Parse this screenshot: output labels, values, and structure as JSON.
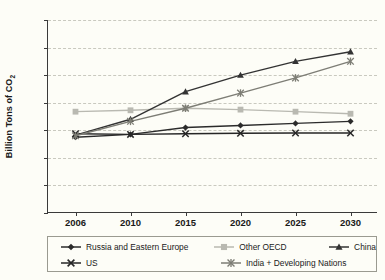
{
  "chart_data": {
    "type": "line",
    "title": "",
    "xlabel": "",
    "ylabel": "Billion Tons of CO",
    "ylabel_sub": "2",
    "categories": [
      "2006",
      "2010",
      "2015",
      "2020",
      "2025",
      "2030"
    ],
    "ylim": [
      0,
      14
    ],
    "ytick_step": 2,
    "yticks": [
      "0",
      "2",
      "4",
      "6",
      "8",
      "10",
      "12",
      "14"
    ],
    "grid": "horizontal-dashed",
    "legend_position": "bottom",
    "series": [
      {
        "name": "Russia and Eastern Europe",
        "marker": "diamond",
        "color": "#2b2b2b",
        "values": [
          5.5,
          5.7,
          6.2,
          6.35,
          6.5,
          6.65
        ]
      },
      {
        "name": "Other OECD",
        "marker": "square",
        "color": "#b9b9b1",
        "values": [
          7.35,
          7.45,
          7.6,
          7.5,
          7.35,
          7.2
        ]
      },
      {
        "name": "China",
        "marker": "triangle",
        "color": "#333333",
        "values": [
          5.65,
          6.8,
          8.8,
          10.0,
          11.0,
          11.7
        ]
      },
      {
        "name": "US",
        "marker": "x",
        "color": "#262626",
        "values": [
          5.75,
          5.7,
          5.75,
          5.78,
          5.8,
          5.8
        ]
      },
      {
        "name": "India + Developing Nations",
        "marker": "asterisk",
        "color": "#7d7d75",
        "values": [
          5.6,
          6.65,
          7.6,
          8.7,
          9.8,
          11.0
        ]
      }
    ]
  },
  "legend": {
    "items": [
      {
        "label": "Russia and Eastern Europe"
      },
      {
        "label": "Other OECD"
      },
      {
        "label": "China"
      },
      {
        "label": "US"
      },
      {
        "label": "India + Developing Nations"
      }
    ]
  },
  "colors": {
    "background": "#fdfdf7",
    "axis": "#3a3a3a",
    "grid": "#c9c9bf",
    "text": "#1a1a1a"
  }
}
